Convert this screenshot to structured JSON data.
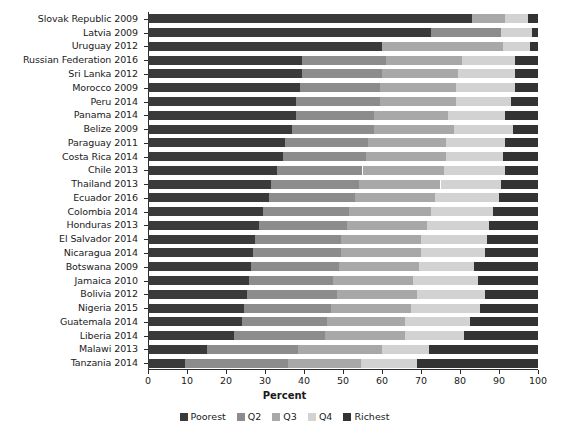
{
  "chart_data": {
    "type": "bar",
    "orientation": "horizontal",
    "stacked": true,
    "stack_mode": "percent",
    "title": "",
    "xlabel": "Percent",
    "ylabel": "",
    "xlim": [
      0,
      100
    ],
    "xticks": [
      0,
      10,
      20,
      30,
      40,
      50,
      60,
      70,
      80,
      90,
      100
    ],
    "xtick_labels": [
      "0",
      "10",
      "20",
      "30",
      "40",
      "50",
      "60",
      "70",
      "80",
      "90",
      "100"
    ],
    "grid": false,
    "legend_position": "bottom",
    "legend_entries": [
      "Poorest",
      "Q2",
      "Q3",
      "Q4",
      "Richest"
    ],
    "colors": {
      "Poorest": "#3a3a3a",
      "Q2": "#8c8c8c",
      "Q3": "#a8a8a8",
      "Q4": "#d2d2d2",
      "Richest": "#333333"
    },
    "categories": [
      "Slovak Republic 2009",
      "Latvia 2009",
      "Uruguay 2012",
      "Russian Federation 2016",
      "Sri Lanka 2012",
      "Morocco 2009",
      "Peru 2014",
      "Panama 2014",
      "Belize 2009",
      "Paraguay 2011",
      "Costa Rica 2014",
      "Chile 2013",
      "Thailand 2013",
      "Ecuador 2016",
      "Colombia 2014",
      "Honduras 2013",
      "El Salvador 2014",
      "Nicaragua 2014",
      "Botswana 2009",
      "Jamaica 2010",
      "Bolivia 2012",
      "Nigeria 2015",
      "Guatemala 2014",
      "Liberia 2014",
      "Malawi 2013",
      "Tanzania 2014"
    ],
    "series": [
      {
        "name": "Poorest",
        "values": [
          83.0,
          72.5,
          60.0,
          39.5,
          39.5,
          39.0,
          38.0,
          38.0,
          37.0,
          35.0,
          34.5,
          33.0,
          31.5,
          31.0,
          29.5,
          28.5,
          27.5,
          27.0,
          26.5,
          26.0,
          25.5,
          24.5,
          24.0,
          22.0,
          15.0,
          9.5
        ]
      },
      {
        "name": "Q2",
        "values": [
          0.0,
          18.0,
          0.0,
          21.5,
          20.5,
          20.5,
          21.5,
          20.0,
          21.0,
          21.5,
          21.5,
          22.0,
          22.5,
          22.0,
          22.0,
          22.5,
          22.0,
          22.5,
          22.5,
          21.5,
          23.0,
          22.5,
          22.0,
          23.5,
          23.5,
          26.5
        ]
      },
      {
        "name": "Q3",
        "values": [
          8.5,
          0.0,
          31.0,
          19.5,
          19.5,
          19.5,
          19.5,
          19.0,
          20.5,
          20.0,
          20.5,
          21.0,
          21.0,
          20.5,
          21.0,
          20.5,
          20.5,
          20.5,
          20.5,
          20.5,
          20.5,
          20.5,
          20.0,
          20.5,
          21.5,
          18.5
        ]
      },
      {
        "name": "Q4",
        "values": [
          6.0,
          8.0,
          7.0,
          13.5,
          14.5,
          15.0,
          14.0,
          14.5,
          15.0,
          15.0,
          14.5,
          15.5,
          15.5,
          16.5,
          16.0,
          16.0,
          17.0,
          16.5,
          14.0,
          16.5,
          17.5,
          17.5,
          16.5,
          15.0,
          12.0,
          14.5
        ]
      },
      {
        "name": "Richest",
        "values": [
          2.5,
          1.5,
          2.0,
          6.0,
          6.0,
          6.0,
          7.0,
          8.5,
          6.5,
          8.5,
          9.0,
          8.5,
          9.5,
          10.0,
          11.5,
          12.5,
          13.0,
          13.5,
          16.5,
          15.5,
          13.5,
          15.0,
          17.5,
          19.0,
          28.0,
          31.0
        ]
      }
    ]
  }
}
